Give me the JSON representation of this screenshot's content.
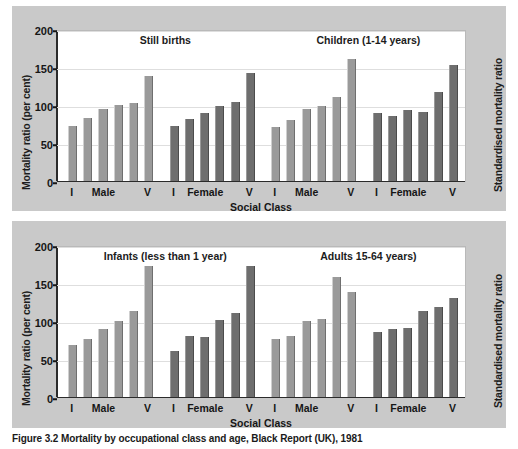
{
  "figure": {
    "caption": "Figure 3.2  Mortality by occupational class and age, Black Report (UK), 1981",
    "axis_left_label": "Mortality ratio (per cent)",
    "axis_right_label": "Standardised mortality ratio",
    "axis_x_label": "Social Class",
    "colors": {
      "male_bar": "#9a9a9a",
      "female_bar": "#6e6e6e",
      "panel_background": "#c9c9c9",
      "plot_background": "#ffffff",
      "gridline": "#dedede",
      "axis": "#2b2b2b"
    }
  },
  "chart_data": [
    {
      "type": "bar",
      "title": "Still births",
      "xlabel": "Social Class",
      "ylabel": "Mortality ratio (per cent)",
      "ylim": [
        0,
        200
      ],
      "yticks": [
        0,
        50,
        100,
        150,
        200
      ],
      "grid": true,
      "legend": "none",
      "categories": [
        "I",
        "II",
        "IIIN",
        "IIIM",
        "IV",
        "V"
      ],
      "group_labels": [
        "Male",
        "Female"
      ],
      "axis_tick_labels": [
        "I",
        "Male",
        "V",
        "I",
        "Female",
        "V"
      ],
      "series": [
        {
          "name": "Male",
          "color": "#9a9a9a",
          "values": [
            72,
            83,
            95,
            100,
            102,
            138
          ]
        },
        {
          "name": "Female",
          "color": "#6e6e6e",
          "values": [
            72,
            82,
            89,
            99,
            104,
            142
          ]
        }
      ]
    },
    {
      "type": "bar",
      "title": "Children (1-14 years)",
      "xlabel": "Social Class",
      "ylabel": "Standardised mortality ratio",
      "ylim": [
        0,
        200
      ],
      "yticks": [
        0,
        50,
        100,
        150,
        200
      ],
      "grid": true,
      "legend": "none",
      "categories": [
        "I",
        "II",
        "IIIN",
        "IIIM",
        "IV",
        "V"
      ],
      "group_labels": [
        "Male",
        "Female"
      ],
      "axis_tick_labels": [
        "I",
        "Male",
        "V",
        "I",
        "Female",
        "V"
      ],
      "series": [
        {
          "name": "Male",
          "color": "#9a9a9a",
          "values": [
            71,
            80,
            95,
            99,
            111,
            160
          ]
        },
        {
          "name": "Female",
          "color": "#6e6e6e",
          "values": [
            90,
            85,
            94,
            91,
            117,
            153
          ]
        }
      ]
    },
    {
      "type": "bar",
      "title": "Infants (less than 1 year)",
      "xlabel": "Social Class",
      "ylabel": "Mortality ratio (per cent)",
      "ylim": [
        0,
        200
      ],
      "yticks": [
        0,
        50,
        100,
        150,
        200
      ],
      "grid": true,
      "legend": "none",
      "categories": [
        "I",
        "II",
        "IIIN",
        "IIIM",
        "IV",
        "V"
      ],
      "group_labels": [
        "Male",
        "Female"
      ],
      "axis_tick_labels": [
        "I",
        "Male",
        "V",
        "I",
        "Female",
        "V"
      ],
      "series": [
        {
          "name": "Male",
          "color": "#9a9a9a",
          "values": [
            68,
            76,
            90,
            100,
            113,
            173
          ]
        },
        {
          "name": "Female",
          "color": "#6e6e6e",
          "values": [
            60,
            80,
            79,
            101,
            110,
            173
          ]
        }
      ]
    },
    {
      "type": "bar",
      "title": "Adults 15-64 years)",
      "xlabel": "Social Class",
      "ylabel": "Standardised mortality ratio",
      "ylim": [
        0,
        200
      ],
      "yticks": [
        0,
        50,
        100,
        150,
        200
      ],
      "grid": true,
      "legend": "none",
      "categories": [
        "I",
        "II",
        "IIIN",
        "IIIM",
        "IV",
        "V"
      ],
      "group_labels": [
        "Male",
        "Female"
      ],
      "axis_tick_labels": [
        "I",
        "Male",
        "V",
        "I",
        "Female",
        "V"
      ],
      "series": [
        {
          "name": "Male",
          "color": "#9a9a9a",
          "values": [
            76,
            80,
            100,
            103,
            158,
            138
          ]
        },
        {
          "name": "Female",
          "color": "#6e6e6e",
          "values": [
            85,
            90,
            91,
            113,
            118,
            130
          ]
        }
      ]
    }
  ]
}
